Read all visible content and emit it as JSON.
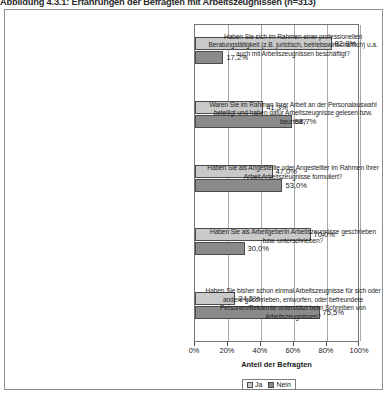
{
  "figure": {
    "caption": "Abbildung 4.3.1: Erfahrungen der Befragten mit Arbeitszeugnissen (n=313)"
  },
  "chart_data": {
    "type": "bar",
    "orientation": "horizontal",
    "title": "Abbildung 4.3.1: Erfahrungen der Befragten mit Arbeitszeugnissen (n=313)",
    "xlabel": "Anteil der Befragten",
    "ylabel": "",
    "xlim": [
      0,
      100
    ],
    "xticks": [
      0,
      20,
      40,
      60,
      80,
      100
    ],
    "xticklabels": [
      "0%",
      "20%",
      "40%",
      "60%",
      "80%",
      "100%"
    ],
    "grid": true,
    "legend_position": "bottom",
    "categories": [
      "Haben Sie sich im Rahmen einer professionellen Beratungstätigkeit (z.B. juristisch, betriebswirtschaftlich) u.a. auch mit Arbeitszeugnissen beschäftigt?",
      "Waren Sie im Rahmen Ihrer Arbeit an der Personalauswahl beteiligt und haben dafür Arbeitszeugnisse gelesen bzw. beurteilt?",
      "Haben Sie als Angestellte oder Angestellter im Rahmen Ihrer Arbeit Arbeitszeugnisse formuliert?",
      "Haben Sie als ArbeitgeberIn Arbeitszeugnisse geschrieben bzw. unterschrieben?",
      "Haben Sie bisher schon einmal Arbeitszeugnisse für sich oder andere geschrieben, entworfen, oder befreundete Personen/Bekannte unterstützt beim Schreiben von Arbeitszeugnissen?"
    ],
    "series": [
      {
        "name": "Ja",
        "color": "#c9c9c9",
        "values": [
          82.8,
          41.3,
          47.0,
          70.0,
          24.5
        ],
        "labels": [
          "82,8%",
          "41,3%",
          "47,0%",
          "70,0%",
          "24,5%"
        ]
      },
      {
        "name": "Nein",
        "color": "#8a8a8a",
        "values": [
          17.2,
          58.7,
          53.0,
          30.0,
          75.5
        ],
        "labels": [
          "17,2%",
          "58,7%",
          "53,0%",
          "30,0%",
          "75,5%"
        ]
      }
    ]
  },
  "legend": {
    "items": [
      {
        "label": "Ja"
      },
      {
        "label": "Nein"
      }
    ]
  }
}
